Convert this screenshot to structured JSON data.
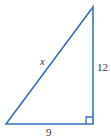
{
  "figure": {
    "type": "right-triangle",
    "stroke_color": "#3a6fc4",
    "label_color": "#333333",
    "vertices": {
      "bottom_left": [
        6,
        124
      ],
      "bottom_right": [
        93,
        124
      ],
      "top_right": [
        93,
        7
      ]
    },
    "right_angle_marker": {
      "corner": "bottom_right",
      "size": 7
    },
    "labels": {
      "hypotenuse": "x",
      "vertical_leg": "12",
      "horizontal_leg": "9"
    }
  }
}
